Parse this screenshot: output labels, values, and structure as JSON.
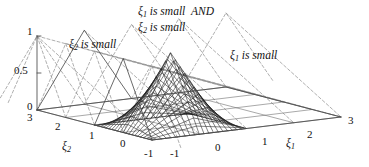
{
  "figure": {
    "kind": "3d-surface-mesh",
    "background": "#ffffff",
    "line_color": "#111111",
    "dashed_color": "#8a8a8a"
  },
  "title": {
    "line1_pre": "ξ",
    "line1_sub": "1",
    "line1_mid": " is small",
    "line1_op": "AND",
    "line2_pre": "ξ",
    "line2_sub": "2",
    "line2_mid": " is small"
  },
  "annotations": [
    {
      "name": "xi2-is-small",
      "pre": "ξ",
      "sub": "2",
      "post": " is small"
    },
    {
      "name": "xi1-is-small",
      "pre": "ξ",
      "sub": "1",
      "post": " is small"
    }
  ],
  "axes": {
    "z": {
      "name": "membership",
      "ticks": [
        "1",
        "0.5",
        "0"
      ],
      "range": [
        0,
        1
      ]
    },
    "xi1": {
      "label_pre": "ξ",
      "label_sub": "1",
      "ticks": [
        "-1",
        "0",
        "1",
        "2",
        "3"
      ],
      "range": [
        -1,
        3
      ]
    },
    "xi2": {
      "label_pre": "ξ",
      "label_sub": "2",
      "ticks": [
        "3",
        "2",
        "1",
        "0",
        "-1"
      ],
      "range": [
        -1,
        3
      ]
    }
  },
  "chart_data": {
    "type": "surface",
    "xlabel": "ξ1",
    "ylabel": "ξ2",
    "zlabel": "membership",
    "xlim": [
      -1,
      3
    ],
    "ylim": [
      -1,
      3
    ],
    "zlim": [
      0,
      1
    ],
    "xticks": [
      -1,
      0,
      1,
      2,
      3
    ],
    "yticks": [
      -1,
      0,
      1,
      2,
      3
    ],
    "zticks": [
      0,
      0.5,
      1
    ],
    "grid": true,
    "legend": "none",
    "surface": {
      "description": "min/product of two triangular membership functions peaking at (0,0)",
      "peak": {
        "xi1": 0,
        "xi2": 0,
        "z": 1
      },
      "mesh_n": 21,
      "formula": "z = max(0,1-|xi1|) * max(0,1-|xi2|)"
    },
    "membership_functions": {
      "shape": "triangular",
      "half_width": 1,
      "centers": [
        -1,
        0,
        1,
        2,
        3
      ],
      "highlighted_center": 0,
      "highlighted_style": "solid",
      "other_style": "dashed"
    }
  }
}
